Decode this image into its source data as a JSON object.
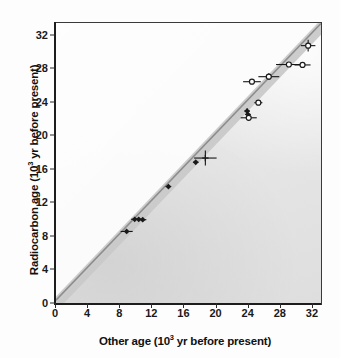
{
  "chart_data": {
    "type": "scatter",
    "title": "",
    "xlabel": "Other age (10³ yr before present)",
    "ylabel": "Radiocarbon age (10³ yr before present)",
    "xlabel_main": "Other age (10",
    "xlabel_sup": "3",
    "xlabel_tail": " yr before present)",
    "ylabel_main": "Radiocarbon age (10",
    "ylabel_sup": "3",
    "ylabel_tail": " yr before present)",
    "xlim": [
      0,
      33
    ],
    "ylim": [
      0,
      33.5
    ],
    "xticks": [
      0,
      4,
      8,
      12,
      16,
      20,
      24,
      28,
      32
    ],
    "yticks": [
      0,
      4,
      8,
      12,
      16,
      20,
      24,
      28,
      32
    ],
    "grid": false,
    "legend": "none",
    "reference_line": {
      "name": "one-to-one-line",
      "slope": 1,
      "intercept": 0,
      "color": "#8d8d8d",
      "band_color": "#c9c9c9",
      "band_width_units": 0.9,
      "label": "1:1 line"
    },
    "series": [
      {
        "name": "filled-diamond-series",
        "marker": "filled-diamond",
        "color": "#1a1a1a",
        "points": [
          {
            "x": 8.8,
            "y": 8.65,
            "xerr": 0.75,
            "yerr": 0.0
          },
          {
            "x": 9.8,
            "y": 10.1,
            "xerr": 0.45,
            "yerr": 0.0
          },
          {
            "x": 10.3,
            "y": 10.1,
            "xerr": 0.45,
            "yerr": 0.0
          },
          {
            "x": 10.8,
            "y": 10.05,
            "xerr": 0.45,
            "yerr": 0.0
          },
          {
            "x": 14.0,
            "y": 14.0,
            "xerr": 0.35,
            "yerr": 0.0
          },
          {
            "x": 17.4,
            "y": 16.9,
            "xerr": 0.35,
            "yerr": 0.0
          },
          {
            "x": 23.8,
            "y": 23.0,
            "xerr": 0.35,
            "yerr": 0.35
          },
          {
            "x": 23.9,
            "y": 22.6,
            "xerr": 0.35,
            "yerr": 0.0
          }
        ]
      },
      {
        "name": "open-circle-series",
        "marker": "open-circle",
        "color": "#1a1a1a",
        "points": [
          {
            "x": 24.0,
            "y": 22.2,
            "xerr": 1.0,
            "yerr": 0.0
          },
          {
            "x": 25.2,
            "y": 24.0,
            "xerr": 0.5,
            "yerr": 0.0
          },
          {
            "x": 24.4,
            "y": 26.5,
            "xerr": 1.1,
            "yerr": 0.0
          },
          {
            "x": 26.5,
            "y": 27.1,
            "xerr": 1.3,
            "yerr": 0.4
          },
          {
            "x": 29.0,
            "y": 28.55,
            "xerr": 1.6,
            "yerr": 0.0
          },
          {
            "x": 30.7,
            "y": 28.5,
            "xerr": 1.0,
            "yerr": 0.0
          },
          {
            "x": 31.4,
            "y": 30.8,
            "xerr": 0.9,
            "yerr": 0.7
          }
        ]
      },
      {
        "name": "cross-marker-series",
        "marker": "cross",
        "color": "#1a1a1a",
        "points": [
          {
            "x": 18.6,
            "y": 17.4,
            "xerr": 1.4,
            "yerr": 0.9
          }
        ]
      }
    ]
  },
  "axes": {
    "x_tick_labels": [
      "0",
      "4",
      "8",
      "12",
      "16",
      "20",
      "24",
      "28",
      "32"
    ],
    "y_tick_labels": [
      "0",
      "4",
      "8",
      "12",
      "16",
      "20",
      "24",
      "28",
      "32"
    ]
  }
}
